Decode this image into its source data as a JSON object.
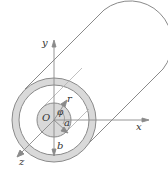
{
  "diagram": {
    "type": "coaxial cylinder with cylindrical coordinates",
    "labels": {
      "y_axis": "y",
      "x_axis": "x",
      "z_axis": "z",
      "origin": "O",
      "radius_r": "r",
      "angle_phi": "φ",
      "inner_radius": "a",
      "outer_radius": "b"
    },
    "colors": {
      "stroke": "#8a8a8a",
      "ring_fill": "#d9d9d9",
      "core_fill": "#d9d9d9",
      "text": "#333333"
    }
  }
}
